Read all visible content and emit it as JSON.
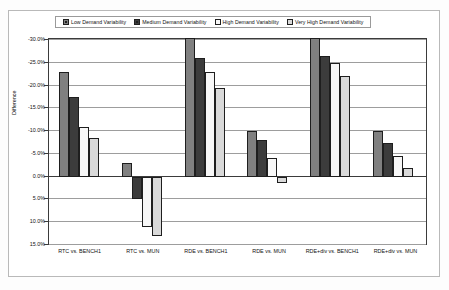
{
  "chart_data": {
    "type": "bar",
    "title": "",
    "xlabel": "",
    "ylabel": "Difference",
    "ylim": [
      -30.0,
      15.0
    ],
    "y_inverted": true,
    "grid": true,
    "legend_position": "top",
    "y_ticks": [
      "-30.0%",
      "-25.0%",
      "-20.0%",
      "-15.0%",
      "-10.0%",
      "-5.0%",
      "0.0%",
      "5.0%",
      "10.0%",
      "15.0%"
    ],
    "y_tick_values": [
      -30.0,
      -25.0,
      -20.0,
      -15.0,
      -10.0,
      -5.0,
      0.0,
      5.0,
      10.0,
      15.0
    ],
    "categories": [
      "RTC vs. BENCH1",
      "RTC vs. MUN",
      "RDE vs. BENCH1",
      "RDE vs. MUN",
      "RDE+div vs. BENCH1",
      "RDE+div vs. MUN"
    ],
    "series": [
      {
        "name": "Low Demand Variability",
        "color": "#808080",
        "values": [
          -23.0,
          -3.0,
          -30.5,
          -10.0,
          -30.5,
          -10.0
        ]
      },
      {
        "name": "Medium Demand Variability",
        "color": "#3c3c3c",
        "values": [
          -17.5,
          5.0,
          -26.0,
          -8.0,
          -26.5,
          -7.5
        ]
      },
      {
        "name": "High Demand Variability",
        "color": "#f7f7f7",
        "values": [
          -11.0,
          11.0,
          -23.0,
          -4.0,
          -25.0,
          -4.5
        ]
      },
      {
        "name": "Very High Demand Variability",
        "color": "#d9d9d9",
        "values": [
          -8.5,
          13.0,
          -19.5,
          1.5,
          -22.0,
          -2.0
        ]
      }
    ]
  },
  "legend": {
    "items": [
      {
        "label": "Low Demand Variability"
      },
      {
        "label": "Medium Demand Variability"
      },
      {
        "label": "High Demand Variability"
      },
      {
        "label": "Very High Demand Variability"
      }
    ]
  }
}
